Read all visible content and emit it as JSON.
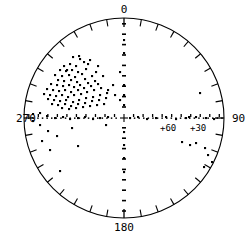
{
  "chart_data": {
    "type": "scatter",
    "projection": "polar-stereographic",
    "title": "",
    "xlabel": "",
    "ylabel": "",
    "grid": true,
    "legend": null,
    "center": {
      "x": 124,
      "y": 118
    },
    "radius": 100,
    "azimuth_labels": [
      {
        "value": "0",
        "angle_deg": 0,
        "position": "top"
      },
      {
        "value": "90",
        "angle_deg": 90,
        "position": "right"
      },
      {
        "value": "180",
        "angle_deg": 180,
        "position": "bottom"
      },
      {
        "value": "270",
        "angle_deg": 270,
        "position": "left"
      }
    ],
    "latitude_labels": [
      {
        "value": "+60",
        "radius_frac": 0.33
      },
      {
        "value": "+30",
        "radius_frac": 0.66
      }
    ],
    "tick_interval_deg": 10,
    "tick_length": 7,
    "equator_line": "dotted-horizontal",
    "meridian_line": "dashed-vertical",
    "point_count": 112,
    "points": [
      [
        73,
        57
      ],
      [
        80,
        59
      ],
      [
        84,
        62
      ],
      [
        64,
        66
      ],
      [
        70,
        64
      ],
      [
        76,
        66
      ],
      [
        88,
        64
      ],
      [
        60,
        70
      ],
      [
        66,
        71
      ],
      [
        72,
        70
      ],
      [
        78,
        72
      ],
      [
        55,
        75
      ],
      [
        62,
        76
      ],
      [
        69,
        75
      ],
      [
        75,
        77
      ],
      [
        82,
        74
      ],
      [
        58,
        80
      ],
      [
        64,
        81
      ],
      [
        71,
        80
      ],
      [
        77,
        82
      ],
      [
        85,
        79
      ],
      [
        92,
        76
      ],
      [
        51,
        84
      ],
      [
        57,
        85
      ],
      [
        63,
        86
      ],
      [
        69,
        85
      ],
      [
        74,
        87
      ],
      [
        80,
        85
      ],
      [
        88,
        83
      ],
      [
        95,
        81
      ],
      [
        47,
        89
      ],
      [
        53,
        90
      ],
      [
        59,
        91
      ],
      [
        65,
        90
      ],
      [
        71,
        92
      ],
      [
        78,
        90
      ],
      [
        84,
        88
      ],
      [
        91,
        86
      ],
      [
        98,
        84
      ],
      [
        44,
        94
      ],
      [
        50,
        95
      ],
      [
        56,
        96
      ],
      [
        62,
        95
      ],
      [
        68,
        97
      ],
      [
        74,
        95
      ],
      [
        81,
        94
      ],
      [
        87,
        92
      ],
      [
        94,
        90
      ],
      [
        101,
        88
      ],
      [
        48,
        99
      ],
      [
        54,
        100
      ],
      [
        60,
        101
      ],
      [
        66,
        100
      ],
      [
        73,
        102
      ],
      [
        79,
        100
      ],
      [
        86,
        98
      ],
      [
        93,
        97
      ],
      [
        100,
        95
      ],
      [
        107,
        93
      ],
      [
        52,
        104
      ],
      [
        58,
        105
      ],
      [
        65,
        104
      ],
      [
        71,
        106
      ],
      [
        78,
        104
      ],
      [
        85,
        103
      ],
      [
        92,
        101
      ],
      [
        99,
        100
      ],
      [
        106,
        98
      ],
      [
        62,
        108
      ],
      [
        69,
        109
      ],
      [
        76,
        108
      ],
      [
        83,
        107
      ],
      [
        90,
        106
      ],
      [
        97,
        105
      ],
      [
        104,
        104
      ],
      [
        67,
        70
      ],
      [
        79,
        56
      ],
      [
        86,
        69
      ],
      [
        96,
        72
      ],
      [
        103,
        76
      ],
      [
        98,
        66
      ],
      [
        90,
        60
      ],
      [
        113,
        85
      ],
      [
        108,
        90
      ],
      [
        115,
        95
      ],
      [
        120,
        100
      ],
      [
        33,
        114
      ],
      [
        40,
        113
      ],
      [
        47,
        116
      ],
      [
        55,
        118
      ],
      [
        63,
        117
      ],
      [
        70,
        119
      ],
      [
        78,
        118
      ],
      [
        85,
        117
      ],
      [
        93,
        119
      ],
      [
        100,
        118
      ],
      [
        108,
        117
      ],
      [
        33,
        121
      ],
      [
        40,
        125
      ],
      [
        48,
        131
      ],
      [
        57,
        136
      ],
      [
        72,
        128
      ],
      [
        106,
        125
      ],
      [
        130,
        118
      ],
      [
        138,
        117
      ],
      [
        147,
        119
      ],
      [
        156,
        118
      ],
      [
        166,
        117
      ],
      [
        176,
        119
      ],
      [
        186,
        118
      ],
      [
        196,
        117
      ],
      [
        206,
        118
      ],
      [
        214,
        119
      ],
      [
        200,
        93
      ],
      [
        189,
        117
      ],
      [
        182,
        142
      ],
      [
        190,
        145
      ],
      [
        196,
        143
      ],
      [
        205,
        148
      ],
      [
        208,
        155
      ],
      [
        212,
        162
      ],
      [
        216,
        168
      ],
      [
        204,
        167
      ],
      [
        213,
        175
      ],
      [
        200,
        196
      ],
      [
        206,
        198
      ],
      [
        193,
        200
      ],
      [
        60,
        171
      ],
      [
        50,
        150
      ],
      [
        42,
        141
      ],
      [
        78,
        146
      ],
      [
        120,
        72
      ],
      [
        124,
        85
      ],
      [
        124,
        95
      ],
      [
        124,
        105
      ],
      [
        124,
        132
      ],
      [
        124,
        145
      ],
      [
        124,
        158
      ],
      [
        124,
        172
      ],
      [
        124,
        40
      ],
      [
        124,
        53
      ]
    ]
  },
  "icons": {
    "data_point": "dot-marker"
  },
  "colors": {
    "background": "#ffffff",
    "foreground": "#000000",
    "point": "#000000"
  }
}
